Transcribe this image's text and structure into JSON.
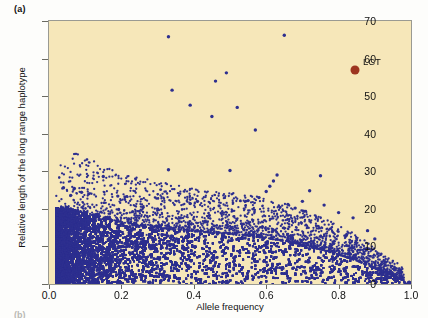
{
  "figure": {
    "panel_label": "(a)",
    "next_panel_label": "(b)",
    "background_color": "#f6e7b9",
    "frame_color": "#9a9a92"
  },
  "chart_data": {
    "type": "scatter",
    "title": "",
    "xlabel": "Allele frequency",
    "ylabel": "Relative length of the long range haplotype",
    "xlim": [
      0.0,
      1.0
    ],
    "ylim": [
      0,
      70
    ],
    "xticks": [
      "0.0",
      "0.2",
      "0.4",
      "0.6",
      "0.8",
      "1.0"
    ],
    "xtick_values": [
      0.0,
      0.2,
      0.4,
      0.6,
      0.8,
      1.0
    ],
    "yticks": [
      "0",
      "10",
      "20",
      "30",
      "40",
      "50",
      "60",
      "70"
    ],
    "ytick_values": [
      0,
      10,
      20,
      30,
      40,
      50,
      60,
      70
    ],
    "grid": false,
    "legend": "none",
    "plot_bgcolor": "#f6e7b9",
    "series": [
      {
        "name": "genome-wide SNPs",
        "color": "#2d2f8f",
        "marker": "circle",
        "marker_size": 2.2,
        "description": "Dense cloud of many thousands of points; bulk lies below a declining upper envelope that starts near 20 at low allele frequency and falls toward 0 near allele frequency 1.0, with a scatter of higher outliers.",
        "n_points_approx": 9000,
        "envelope_x": [
          0.02,
          0.05,
          0.1,
          0.15,
          0.2,
          0.25,
          0.3,
          0.35,
          0.4,
          0.45,
          0.5,
          0.55,
          0.6,
          0.65,
          0.7,
          0.75,
          0.8,
          0.85,
          0.9,
          0.95,
          0.99
        ],
        "envelope_y": [
          20.0,
          20.2,
          19.0,
          17.6,
          16.4,
          15.6,
          15.0,
          14.4,
          14.0,
          13.6,
          13.2,
          12.8,
          12.2,
          11.4,
          10.4,
          9.2,
          7.8,
          6.2,
          4.2,
          2.0,
          0.6
        ]
      },
      {
        "name": "outlier points",
        "color": "#2d2f8f",
        "marker": "circle",
        "marker_size": 3.0,
        "points": [
          [
            0.33,
            65.8
          ],
          [
            0.65,
            66.2
          ],
          [
            0.49,
            56.2
          ],
          [
            0.46,
            54.0
          ],
          [
            0.34,
            51.6
          ],
          [
            0.39,
            47.6
          ],
          [
            0.52,
            47.0
          ],
          [
            0.45,
            44.6
          ],
          [
            0.57,
            41.0
          ],
          [
            0.33,
            30.4
          ],
          [
            0.5,
            30.2
          ],
          [
            0.15,
            28.6
          ],
          [
            0.63,
            29.0
          ],
          [
            0.75,
            28.8
          ],
          [
            0.62,
            27.4
          ],
          [
            0.61,
            26.0
          ],
          [
            0.19,
            23.4
          ],
          [
            0.21,
            23.2
          ],
          [
            0.6,
            24.6
          ],
          [
            0.72,
            24.8
          ],
          [
            0.58,
            23.0
          ],
          [
            0.07,
            25.4
          ],
          [
            0.04,
            25.6
          ],
          [
            0.09,
            24.4
          ],
          [
            0.11,
            24.0
          ],
          [
            0.06,
            23.6
          ],
          [
            0.41,
            22.0
          ],
          [
            0.39,
            21.4
          ],
          [
            0.55,
            22.2
          ],
          [
            0.7,
            22.0
          ],
          [
            0.66,
            21.2
          ],
          [
            0.76,
            21.0
          ],
          [
            0.26,
            20.4
          ],
          [
            0.3,
            20.0
          ],
          [
            0.47,
            20.8
          ],
          [
            0.68,
            20.2
          ],
          [
            0.8,
            19.0
          ],
          [
            0.84,
            17.6
          ],
          [
            0.88,
            14.2
          ],
          [
            0.9,
            12.0
          ]
        ]
      }
    ],
    "annotations": [
      {
        "label": "LCT",
        "x": 0.845,
        "y": 57.0,
        "marker": "circle",
        "marker_size": 9,
        "color": "#9d3520",
        "label_position": "right"
      }
    ]
  }
}
